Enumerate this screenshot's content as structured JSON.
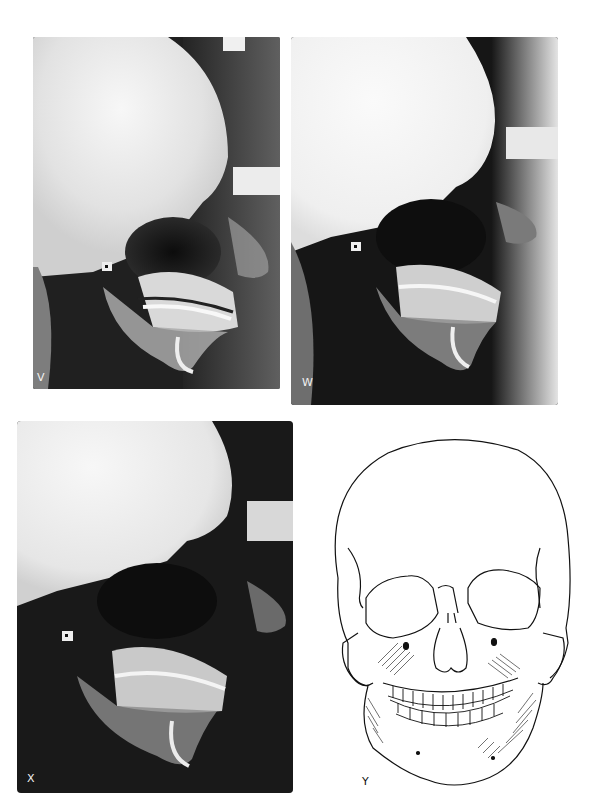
{
  "figure": {
    "panels": [
      {
        "id": "V",
        "label": "V",
        "type": "lateral-cephalometric-radiograph"
      },
      {
        "id": "W",
        "label": "W",
        "type": "lateral-cephalometric-radiograph"
      },
      {
        "id": "X",
        "label": "X",
        "type": "lateral-cephalometric-radiograph"
      },
      {
        "id": "Y",
        "label": "Y",
        "type": "frontal-skull-line-drawing"
      }
    ]
  },
  "colors": {
    "page_background": "#ffffff",
    "xray_dark": "#141414",
    "xray_bright": "#f4f4f4",
    "ink": "#111111"
  }
}
